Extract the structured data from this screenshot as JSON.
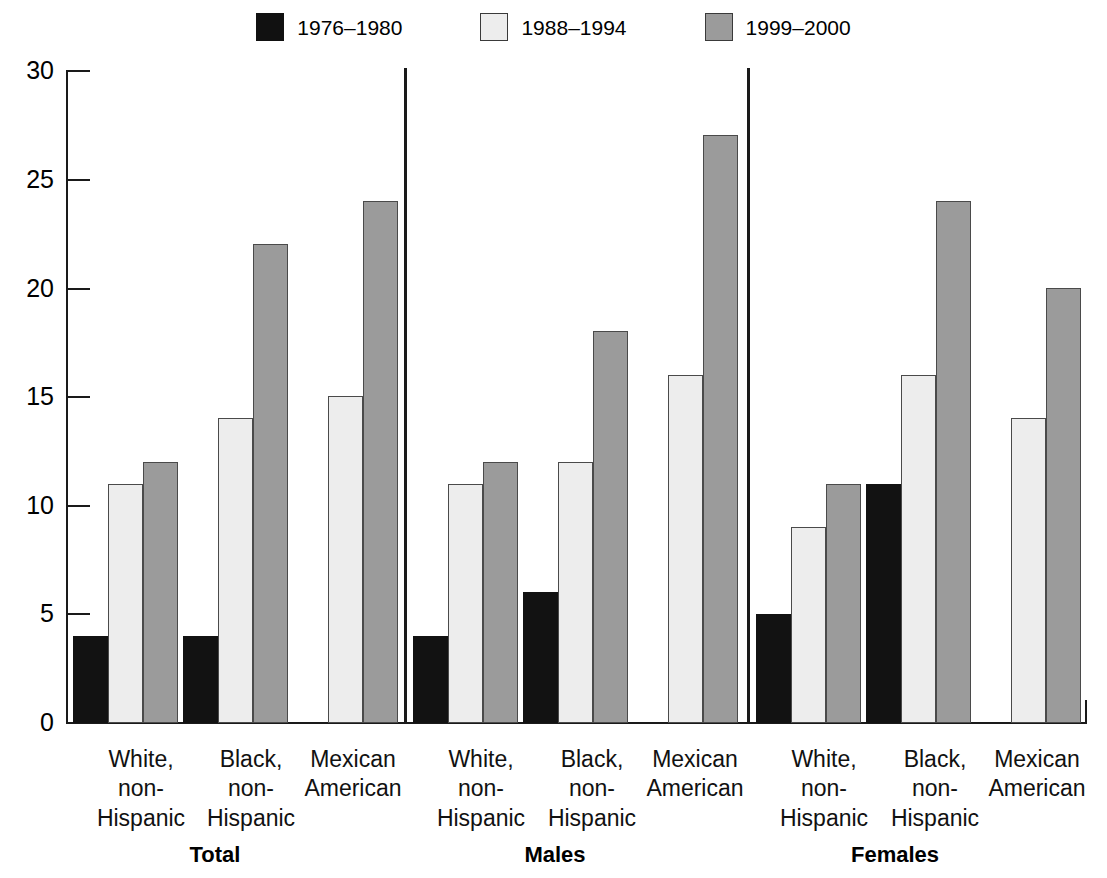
{
  "legend": {
    "items": [
      {
        "label": "1976–1980",
        "swatch": "black-swatch-icon",
        "color": "#111111"
      },
      {
        "label": "1988–1994",
        "swatch": "light-swatch-icon",
        "color": "#ededed"
      },
      {
        "label": "1999–2000",
        "swatch": "gray-swatch-icon",
        "color": "#9b9b9b"
      }
    ]
  },
  "axis": {
    "y_ticks": [
      "0",
      "5",
      "10",
      "15",
      "20",
      "25",
      "30"
    ]
  },
  "categories": [
    {
      "line1": "White,",
      "line2": "non-",
      "line3": "Hispanic"
    },
    {
      "line1": "Black,",
      "line2": "non-",
      "line3": "Hispanic"
    },
    {
      "line1": "Mexican",
      "line2": "American",
      "line3": ""
    }
  ],
  "groups": [
    {
      "label": "Total"
    },
    {
      "label": "Males"
    },
    {
      "label": "Females"
    }
  ],
  "chart_data": {
    "type": "bar",
    "title": "",
    "xlabel": "",
    "ylabel": "",
    "ylim": [
      0,
      30
    ],
    "ytick_step": 5,
    "grid": false,
    "legend_position": "top-center",
    "panels": [
      "Total",
      "Males",
      "Females"
    ],
    "categories": [
      "White, non-Hispanic",
      "Black, non-Hispanic",
      "Mexican American"
    ],
    "series": [
      {
        "name": "1976–1980",
        "color": "#111111",
        "values": {
          "Total": [
            4,
            4,
            null
          ],
          "Males": [
            4,
            6,
            null
          ],
          "Females": [
            5,
            11,
            null
          ]
        }
      },
      {
        "name": "1988–1994",
        "color": "#ededed",
        "values": {
          "Total": [
            11,
            14,
            15
          ],
          "Males": [
            11,
            12,
            16
          ],
          "Females": [
            9,
            16,
            14
          ]
        }
      },
      {
        "name": "1999–2000",
        "color": "#9b9b9b",
        "values": {
          "Total": [
            12,
            22,
            24
          ],
          "Males": [
            12,
            18,
            27
          ],
          "Females": [
            11,
            24,
            20
          ]
        }
      }
    ]
  }
}
